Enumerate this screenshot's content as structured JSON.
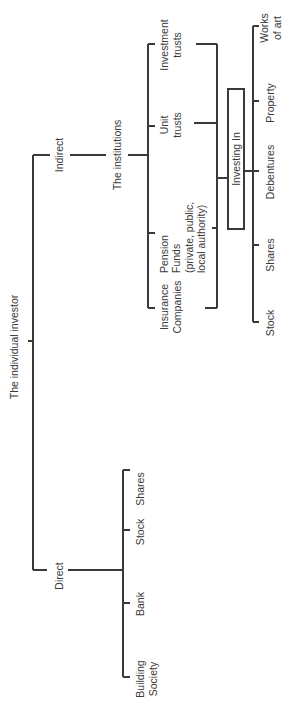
{
  "diagram": {
    "root": {
      "label": "The individual investor"
    },
    "branches": {
      "indirect": {
        "label": "Indirect"
      },
      "direct": {
        "label": "Direct"
      }
    },
    "institutions": {
      "label": "The institutions",
      "items": [
        {
          "lines": [
            "Investment",
            "trusts"
          ]
        },
        {
          "lines": [
            "Unit",
            "trusts"
          ]
        },
        {
          "lines": [
            "Pension",
            "Funds",
            "(private, public,",
            "local authority)"
          ]
        },
        {
          "lines": [
            "Insurance",
            "Companies"
          ]
        }
      ]
    },
    "investing_in": {
      "label": "Investing In",
      "items": [
        {
          "lines": [
            "Works",
            "of art"
          ]
        },
        {
          "lines": [
            "Property"
          ]
        },
        {
          "lines": [
            "Debentures"
          ]
        },
        {
          "lines": [
            "Shares"
          ]
        },
        {
          "lines": [
            "Stock"
          ]
        }
      ]
    },
    "direct_items": [
      {
        "lines": [
          "Shares"
        ]
      },
      {
        "lines": [
          "Stock"
        ]
      },
      {
        "lines": [
          "Bank"
        ]
      },
      {
        "lines": [
          "Building",
          "Society"
        ]
      }
    ]
  }
}
